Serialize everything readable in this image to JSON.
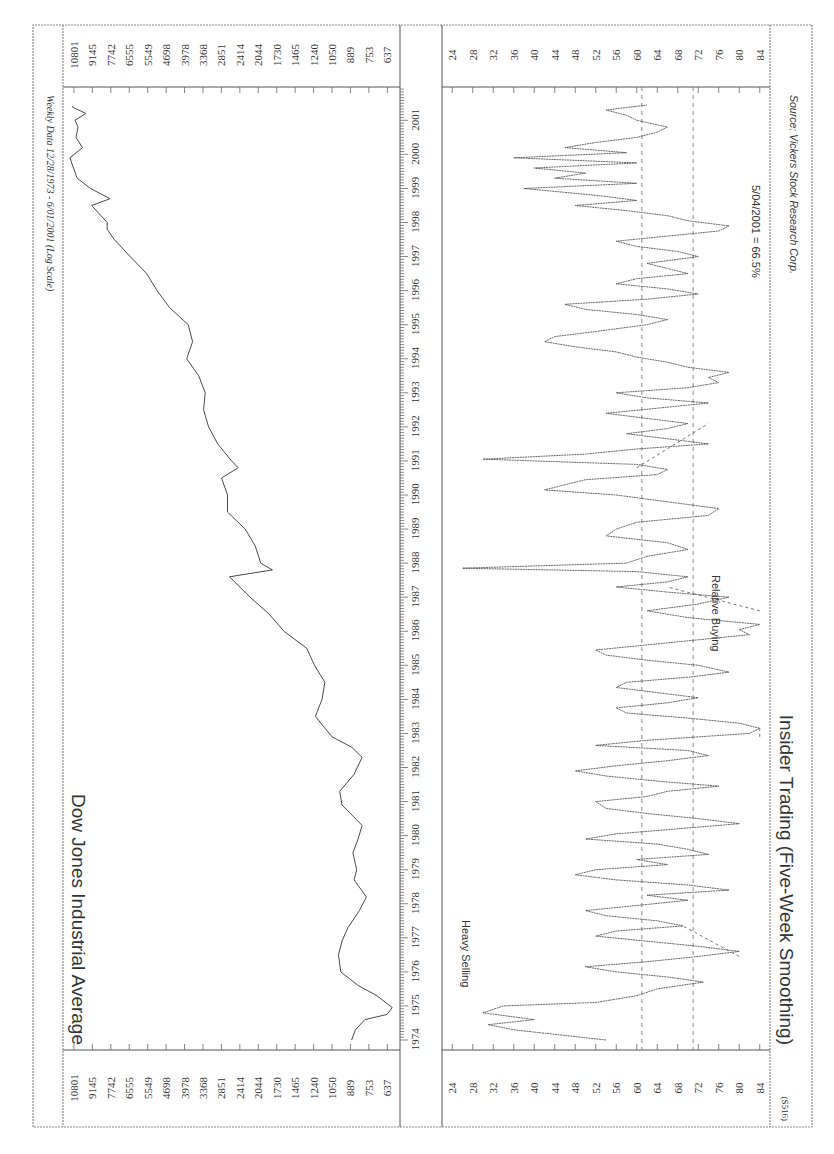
{
  "chart_data": [
    {
      "type": "line",
      "title": "Dow Jones Industrial Average",
      "subtitle": "Weekly Data 12/28/1973 - 6/01/2001 (Log Scale)",
      "xlabel": "",
      "ylabel": "",
      "yscale": "log",
      "ylim": [
        600,
        11500
      ],
      "y_ticks": [
        637,
        753,
        889,
        1050,
        1240,
        1465,
        1730,
        2044,
        2414,
        2851,
        3368,
        3978,
        4698,
        5549,
        6555,
        7742,
        9145,
        10801
      ],
      "x_ticks": [
        "1974",
        "1975",
        "1976",
        "1977",
        "1978",
        "1979",
        "1980",
        "1981",
        "1982",
        "1983",
        "1984",
        "1985",
        "1986",
        "1987",
        "1988",
        "1989",
        "1990",
        "1991",
        "1992",
        "1993",
        "1994",
        "1995",
        "1996",
        "1997",
        "1998",
        "1999",
        "2000",
        "2001"
      ],
      "series": [
        {
          "name": "DJIA",
          "x": [
            1974.0,
            1974.3,
            1974.6,
            1974.75,
            1974.95,
            1975.3,
            1975.6,
            1976.0,
            1976.5,
            1976.9,
            1977.3,
            1977.8,
            1978.2,
            1978.7,
            1979.0,
            1979.5,
            1979.9,
            1980.3,
            1980.9,
            1981.3,
            1981.8,
            1982.3,
            1982.6,
            1982.9,
            1983.5,
            1984.0,
            1984.5,
            1985.0,
            1985.5,
            1986.0,
            1986.5,
            1987.0,
            1987.6,
            1987.8,
            1988.0,
            1988.5,
            1989.0,
            1989.5,
            1990.0,
            1990.5,
            1990.8,
            1991.0,
            1991.5,
            1992.0,
            1992.5,
            1993.0,
            1993.5,
            1994.0,
            1994.5,
            1995.0,
            1995.5,
            1996.0,
            1996.5,
            1997.0,
            1997.5,
            1997.8,
            1998.0,
            1998.5,
            1998.7,
            1999.0,
            1999.3,
            1999.9,
            2000.2,
            2000.5,
            2000.8,
            2001.0,
            2001.2,
            2001.4
          ],
          "values": [
            880,
            850,
            780,
            640,
            610,
            700,
            830,
            970,
            990,
            960,
            910,
            820,
            770,
            860,
            840,
            870,
            830,
            800,
            960,
            980,
            860,
            800,
            880,
            1050,
            1220,
            1150,
            1120,
            1230,
            1320,
            1620,
            1850,
            2200,
            2650,
            1800,
            2000,
            2100,
            2300,
            2700,
            2700,
            2850,
            2450,
            2600,
            2950,
            3200,
            3350,
            3300,
            3500,
            3900,
            3700,
            3850,
            4550,
            5100,
            5600,
            6500,
            7500,
            8000,
            8000,
            9200,
            7800,
            9300,
            10500,
            11200,
            10000,
            10600,
            10400,
            10700,
            9700,
            11000
          ]
        }
      ]
    },
    {
      "type": "line",
      "title": "Insider Trading (Five-Week Smoothing)",
      "xlabel": "",
      "ylabel": "",
      "ylim": [
        22,
        86
      ],
      "y_ticks": [
        84,
        80,
        76,
        72,
        68,
        64,
        60,
        56,
        52,
        48,
        44,
        40,
        36,
        32,
        28,
        24
      ],
      "x_ticks": [
        "1974",
        "1975",
        "1976",
        "1977",
        "1978",
        "1979",
        "1980",
        "1981",
        "1982",
        "1983",
        "1984",
        "1985",
        "1986",
        "1987",
        "1988",
        "1989",
        "1990",
        "1991",
        "1992",
        "1993",
        "1994",
        "1995",
        "1996",
        "1997",
        "1998",
        "1999",
        "2000",
        "2001"
      ],
      "reference_lines": [
        71,
        61
      ],
      "annotations": [
        "Heavy Selling",
        "Relative Buying",
        "5/04/2001 = 66.5%",
        "Source: Vickers Stock Research Corp."
      ],
      "footnote": "(S516)",
      "series": [
        {
          "name": "Insider Trading Ratio (%)",
          "x": [
            1974.0,
            1974.15,
            1974.3,
            1974.45,
            1974.6,
            1974.8,
            1975.0,
            1975.1,
            1975.3,
            1975.5,
            1975.7,
            1975.85,
            1976.0,
            1976.15,
            1976.3,
            1976.45,
            1976.6,
            1976.75,
            1976.9,
            1977.05,
            1977.2,
            1977.35,
            1977.5,
            1977.65,
            1977.8,
            1977.95,
            1978.1,
            1978.25,
            1978.4,
            1978.55,
            1978.7,
            1978.85,
            1979.0,
            1979.15,
            1979.3,
            1979.45,
            1979.6,
            1979.75,
            1979.9,
            1980.05,
            1980.2,
            1980.35,
            1980.5,
            1980.65,
            1980.8,
            1981.0,
            1981.15,
            1981.3,
            1981.45,
            1981.6,
            1981.75,
            1981.9,
            1982.05,
            1982.2,
            1982.35,
            1982.5,
            1982.65,
            1982.8,
            1983.0,
            1983.15,
            1983.3,
            1983.45,
            1983.6,
            1983.75,
            1983.9,
            1984.05,
            1984.2,
            1984.35,
            1984.5,
            1984.65,
            1984.8,
            1985.0,
            1985.15,
            1985.3,
            1985.45,
            1985.6,
            1985.75,
            1985.9,
            1986.05,
            1986.2,
            1986.4,
            1986.6,
            1986.8,
            1987.0,
            1987.15,
            1987.3,
            1987.45,
            1987.6,
            1987.75,
            1987.85,
            1988.0,
            1988.2,
            1988.4,
            1988.6,
            1988.8,
            1989.0,
            1989.2,
            1989.4,
            1989.6,
            1989.8,
            1990.0,
            1990.15,
            1990.3,
            1990.45,
            1990.6,
            1990.75,
            1990.9,
            1991.05,
            1991.2,
            1991.35,
            1991.5,
            1991.65,
            1991.8,
            1991.95,
            1992.1,
            1992.25,
            1992.4,
            1992.55,
            1992.7,
            1992.85,
            1993.0,
            1993.15,
            1993.3,
            1993.45,
            1993.6,
            1993.75,
            1993.9,
            1994.05,
            1994.2,
            1994.35,
            1994.5,
            1994.65,
            1994.8,
            1995.0,
            1995.15,
            1995.3,
            1995.45,
            1995.6,
            1995.75,
            1995.9,
            1996.05,
            1996.2,
            1996.35,
            1996.5,
            1996.65,
            1996.8,
            1997.0,
            1997.15,
            1997.3,
            1997.45,
            1997.6,
            1997.75,
            1997.9,
            1998.05,
            1998.2,
            1998.35,
            1998.5,
            1998.65,
            1998.8,
            1999.0,
            1999.15,
            1999.3,
            1999.45,
            1999.6,
            1999.75,
            1999.9,
            2000.05,
            2000.2,
            2000.35,
            2000.5,
            2000.65,
            2000.8,
            2001.0,
            2001.15,
            2001.3,
            2001.45
          ],
          "values": [
            54,
            45,
            36,
            31,
            40,
            30,
            34,
            52,
            60,
            64,
            73,
            66,
            56,
            50,
            62,
            72,
            80,
            72,
            62,
            52,
            56,
            69,
            64,
            54,
            50,
            60,
            70,
            62,
            78,
            70,
            56,
            48,
            52,
            66,
            60,
            74,
            70,
            64,
            50,
            56,
            68,
            80,
            72,
            62,
            54,
            52,
            62,
            66,
            76,
            64,
            54,
            48,
            56,
            66,
            74,
            70,
            52,
            62,
            82,
            84,
            80,
            70,
            58,
            56,
            66,
            72,
            64,
            56,
            58,
            70,
            78,
            72,
            62,
            54,
            52,
            62,
            72,
            82,
            80,
            84,
            70,
            62,
            72,
            78,
            66,
            56,
            66,
            70,
            60,
            26,
            58,
            62,
            70,
            66,
            54,
            56,
            60,
            74,
            76,
            66,
            56,
            42,
            46,
            50,
            64,
            66,
            60,
            30,
            50,
            60,
            74,
            66,
            58,
            66,
            70,
            62,
            54,
            64,
            74,
            62,
            56,
            70,
            76,
            74,
            78,
            70,
            66,
            60,
            56,
            48,
            42,
            44,
            52,
            62,
            66,
            60,
            50,
            46,
            62,
            72,
            66,
            56,
            60,
            70,
            66,
            62,
            72,
            68,
            60,
            56,
            66,
            76,
            78,
            70,
            66,
            58,
            48,
            60,
            52,
            38,
            60,
            44,
            50,
            40,
            60,
            36,
            58,
            46,
            52,
            60,
            64,
            66,
            60,
            58,
            54,
            62,
            76,
            70,
            72,
            66
          ]
        }
      ]
    }
  ],
  "djia_panel": {
    "title": "Dow Jones Industrial Average",
    "subtitle": "Weekly Data 12/28/1973 - 6/01/2001 (Log Scale)",
    "y_ticks": [
      "10801",
      "9145",
      "7742",
      "6555",
      "5549",
      "4698",
      "3978",
      "3368",
      "2851",
      "2414",
      "2044",
      "1730",
      "1465",
      "1240",
      "1050",
      "889",
      "753",
      "637"
    ]
  },
  "insider_panel": {
    "title": "Insider Trading (Five-Week Smoothing)",
    "label_heavy_selling": "Heavy Selling",
    "label_relative_buying": "Relative Buying",
    "latest_reading": "5/04/2001 = 66.5%",
    "source": "Source: Vickers Stock Research Corp.",
    "footnote": "(S516)",
    "y_ticks": [
      "84",
      "80",
      "76",
      "72",
      "68",
      "64",
      "60",
      "56",
      "52",
      "48",
      "44",
      "40",
      "36",
      "32",
      "28",
      "24"
    ]
  },
  "years": [
    "1974",
    "1975",
    "1976",
    "1977",
    "1978",
    "1979",
    "1980",
    "1981",
    "1982",
    "1983",
    "1984",
    "1985",
    "1986",
    "1987",
    "1988",
    "1989",
    "1990",
    "1991",
    "1992",
    "1993",
    "1994",
    "1995",
    "1996",
    "1997",
    "1998",
    "1999",
    "2000",
    "2001"
  ]
}
